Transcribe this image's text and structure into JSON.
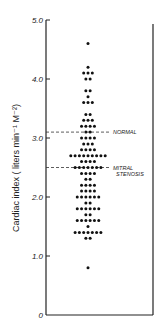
{
  "chart_data": {
    "type": "scatter",
    "subtype": "dot-strip-plot",
    "title": "",
    "xlabel": "",
    "ylabel": "Cardiac index ( liters min⁻¹ M⁻²)",
    "ylim": [
      0,
      5.0
    ],
    "yticks": [
      0,
      1.0,
      2.0,
      3.0,
      4.0,
      5.0
    ],
    "ytick_labels": [
      "0",
      "1.0",
      "2.0",
      "3.0",
      "4.0",
      "5.0"
    ],
    "grid": false,
    "legend": null,
    "rows": [
      {
        "y": 4.6,
        "count": 1
      },
      {
        "y": 4.2,
        "count": 1
      },
      {
        "y": 4.1,
        "count": 3
      },
      {
        "y": 4.0,
        "count": 2
      },
      {
        "y": 3.8,
        "count": 2
      },
      {
        "y": 3.7,
        "count": 1
      },
      {
        "y": 3.6,
        "count": 3
      },
      {
        "y": 3.4,
        "count": 2
      },
      {
        "y": 3.3,
        "count": 3
      },
      {
        "y": 3.2,
        "count": 4
      },
      {
        "y": 3.1,
        "count": 2
      },
      {
        "y": 3.0,
        "count": 4
      },
      {
        "y": 2.9,
        "count": 3
      },
      {
        "y": 2.8,
        "count": 4
      },
      {
        "y": 2.7,
        "count": 9
      },
      {
        "y": 2.6,
        "count": 4
      },
      {
        "y": 2.5,
        "count": 7
      },
      {
        "y": 2.4,
        "count": 4
      },
      {
        "y": 2.3,
        "count": 2
      },
      {
        "y": 2.2,
        "count": 4
      },
      {
        "y": 2.1,
        "count": 4
      },
      {
        "y": 2.0,
        "count": 6
      },
      {
        "y": 1.9,
        "count": 2
      },
      {
        "y": 1.8,
        "count": 6
      },
      {
        "y": 1.7,
        "count": 2
      },
      {
        "y": 1.6,
        "count": 6
      },
      {
        "y": 1.5,
        "count": 1
      },
      {
        "y": 1.4,
        "count": 7
      },
      {
        "y": 1.3,
        "count": 2
      },
      {
        "y": 0.8,
        "count": 1
      }
    ],
    "reference_lines": [
      {
        "y": 3.1,
        "label": "NORMAL",
        "style": "dashed"
      },
      {
        "y": 2.5,
        "label": "MITRAL STENOSIS",
        "label_lines": [
          "MITRAL",
          "STENOSIS"
        ],
        "style": "dashed"
      }
    ]
  }
}
